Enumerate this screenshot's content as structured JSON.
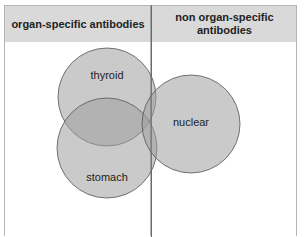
{
  "header": {
    "left_title": "organ-specific antibodies",
    "right_title": "non organ-specific antibodies"
  },
  "circles": [
    {
      "label": "thyroid",
      "cx": 107,
      "cy": 97,
      "r": 49
    },
    {
      "label": "stomach",
      "cx": 107,
      "cy": 148,
      "r": 50
    },
    {
      "label": "nuclear",
      "cx": 191,
      "cy": 124,
      "r": 49
    }
  ],
  "colors": {
    "header_bg": "#d9d9d9",
    "circle_fill": "#a9a9a9",
    "circle_stroke": "#555555"
  }
}
